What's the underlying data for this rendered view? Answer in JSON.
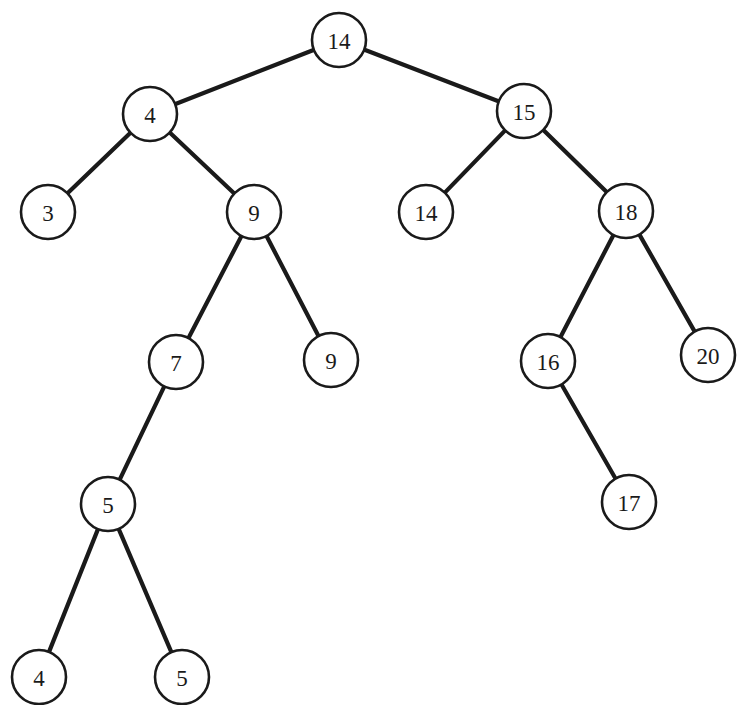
{
  "figure": {
    "kind": "binary-search-tree-diagram",
    "background_color": "#ffffff",
    "node_fill_color": "#ffffff",
    "node_stroke_color": "#1a1a1a",
    "edge_color": "#1a1a1a",
    "label_color": "#1a1a1a",
    "width": 756,
    "height": 705
  },
  "nodes": [
    {
      "id": "n0",
      "label": "14",
      "cx": 339,
      "cy": 40,
      "r": 27
    },
    {
      "id": "n1",
      "label": "4",
      "cx": 150,
      "cy": 114,
      "r": 27
    },
    {
      "id": "n2",
      "label": "15",
      "cx": 524,
      "cy": 111,
      "r": 27
    },
    {
      "id": "n3",
      "label": "3",
      "cx": 48,
      "cy": 212,
      "r": 27
    },
    {
      "id": "n4",
      "label": "9",
      "cx": 254,
      "cy": 212,
      "r": 27
    },
    {
      "id": "n5",
      "label": "14",
      "cx": 426,
      "cy": 212,
      "r": 27
    },
    {
      "id": "n6",
      "label": "18",
      "cx": 626,
      "cy": 211,
      "r": 27
    },
    {
      "id": "n7",
      "label": "7",
      "cx": 176,
      "cy": 362,
      "r": 27
    },
    {
      "id": "n8",
      "label": "9",
      "cx": 331,
      "cy": 360,
      "r": 27
    },
    {
      "id": "n9",
      "label": "16",
      "cx": 548,
      "cy": 361,
      "r": 27
    },
    {
      "id": "n10",
      "label": "20",
      "cx": 708,
      "cy": 355,
      "r": 27
    },
    {
      "id": "n11",
      "label": "5",
      "cx": 108,
      "cy": 504,
      "r": 27
    },
    {
      "id": "n12",
      "label": "17",
      "cx": 629,
      "cy": 502,
      "r": 27
    },
    {
      "id": "n13",
      "label": "4",
      "cx": 39,
      "cy": 677,
      "r": 27
    },
    {
      "id": "n14",
      "label": "5",
      "cx": 182,
      "cy": 677,
      "r": 27
    }
  ],
  "edges": [
    {
      "from": "n0",
      "to": "n1",
      "side": "left"
    },
    {
      "from": "n0",
      "to": "n2",
      "side": "right"
    },
    {
      "from": "n1",
      "to": "n3",
      "side": "left"
    },
    {
      "from": "n1",
      "to": "n4",
      "side": "right"
    },
    {
      "from": "n2",
      "to": "n5",
      "side": "left"
    },
    {
      "from": "n2",
      "to": "n6",
      "side": "right"
    },
    {
      "from": "n4",
      "to": "n7",
      "side": "left"
    },
    {
      "from": "n4",
      "to": "n8",
      "side": "right"
    },
    {
      "from": "n6",
      "to": "n9",
      "side": "left"
    },
    {
      "from": "n6",
      "to": "n10",
      "side": "right"
    },
    {
      "from": "n7",
      "to": "n11",
      "side": "left"
    },
    {
      "from": "n9",
      "to": "n12",
      "side": "right"
    },
    {
      "from": "n11",
      "to": "n13",
      "side": "left"
    },
    {
      "from": "n11",
      "to": "n14",
      "side": "right"
    }
  ]
}
